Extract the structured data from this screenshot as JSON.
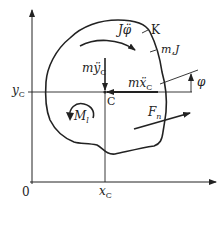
{
  "diagram": {
    "type": "rigid-body free body diagram",
    "colors": {
      "stroke": "#222222",
      "background": "#ffffff"
    },
    "labels": {
      "body_name": "K",
      "mass_inertia": "m,J",
      "inertia_moment_term": "J",
      "inertia_moment_var": "φ̈",
      "force_y_prefix": "mÿ",
      "force_y_sub": "C",
      "force_x_prefix": "mẍ",
      "force_x_sub": "C",
      "center": "C",
      "angle": "φ",
      "moment_load": "M",
      "moment_load_sub": "l",
      "force_n": "F",
      "force_n_sub": "n",
      "axis_y_tick": "y",
      "axis_y_tick_sub": "C",
      "axis_x_tick": "x",
      "axis_x_tick_sub": "C",
      "origin": "0"
    }
  }
}
